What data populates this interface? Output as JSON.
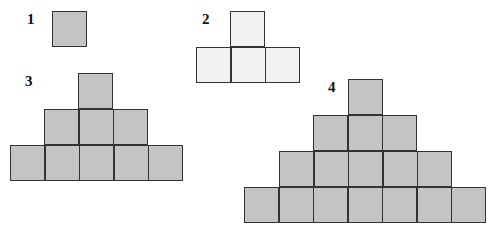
{
  "colors": {
    "dark_fill": "#c4c4c4",
    "light_fill": "#f1f1f1",
    "stroke": "#333333"
  },
  "square_size": 35,
  "figures": [
    {
      "label": "1",
      "label_pos": [
        27,
        12
      ],
      "fill": "dark",
      "rows": [
        {
          "count": 1,
          "x": 52,
          "y": 11
        }
      ]
    },
    {
      "label": "2",
      "label_pos": [
        202,
        12
      ],
      "fill": "light",
      "rows": [
        {
          "count": 1,
          "x": 230,
          "y": 11
        },
        {
          "count": 3,
          "x": 196,
          "y": 47
        }
      ]
    },
    {
      "label": "3",
      "label_pos": [
        25,
        74
      ],
      "fill": "dark",
      "rows": [
        {
          "count": 1,
          "x": 78,
          "y": 73
        },
        {
          "count": 3,
          "x": 44,
          "y": 109
        },
        {
          "count": 5,
          "x": 10,
          "y": 145
        }
      ]
    },
    {
      "label": "4",
      "label_pos": [
        328,
        80
      ],
      "fill": "dark",
      "rows": [
        {
          "count": 1,
          "x": 348,
          "y": 79
        },
        {
          "count": 3,
          "x": 313,
          "y": 115
        },
        {
          "count": 5,
          "x": 279,
          "y": 151
        },
        {
          "count": 7,
          "x": 244,
          "y": 187
        }
      ]
    }
  ]
}
